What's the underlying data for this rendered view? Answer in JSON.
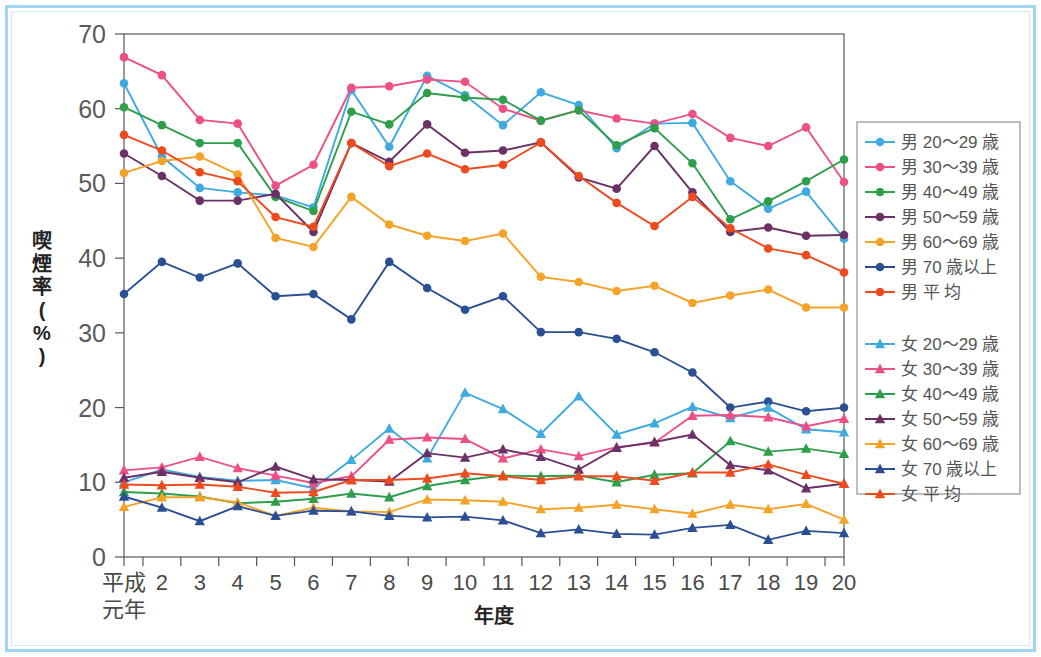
{
  "chart_data": {
    "type": "line",
    "title": "",
    "xlabel": "年度",
    "ylabel": "喫煙率(%)",
    "ylim": [
      0,
      70
    ],
    "ytick_labels": [
      "0",
      "10",
      "20",
      "30",
      "40",
      "50",
      "60",
      "70"
    ],
    "yticks": [
      0,
      10,
      20,
      30,
      40,
      50,
      60,
      70
    ],
    "grid": false,
    "legend_position": "right",
    "x_first_label_line1": "平成",
    "x_first_label_line2": "元年",
    "categories": [
      "平成元年",
      "2",
      "3",
      "4",
      "5",
      "6",
      "7",
      "8",
      "9",
      "10",
      "11",
      "12",
      "13",
      "14",
      "15",
      "16",
      "17",
      "18",
      "19",
      "20"
    ],
    "x_values": [
      1,
      2,
      3,
      4,
      5,
      6,
      7,
      8,
      9,
      10,
      11,
      12,
      13,
      14,
      15,
      16,
      17,
      18,
      19,
      20
    ],
    "series": [
      {
        "name": "男 20～29 歳",
        "group": "male",
        "color": "#3eaae0",
        "marker": "circle",
        "values": [
          63.4,
          53.6,
          49.4,
          48.8,
          48.4,
          46.8,
          62.5,
          54.9,
          64.4,
          61.8,
          57.8,
          62.2,
          60.5,
          54.7,
          58.0,
          58.1,
          50.3,
          46.6,
          48.9,
          42.6
        ]
      },
      {
        "name": "男 30～39 歳",
        "group": "male",
        "color": "#ee4f86",
        "marker": "circle",
        "values": [
          66.9,
          64.5,
          58.5,
          58.0,
          49.7,
          52.5,
          62.8,
          63.0,
          63.9,
          63.6,
          60.0,
          58.4,
          59.8,
          58.7,
          58.0,
          59.3,
          56.1,
          55.0,
          57.5,
          50.2
        ]
      },
      {
        "name": "男 40～49 歳",
        "group": "male",
        "color": "#2e9e4b",
        "marker": "circle",
        "values": [
          60.2,
          57.8,
          55.4,
          55.4,
          48.2,
          46.3,
          59.6,
          57.9,
          62.1,
          61.5,
          61.2,
          58.4,
          59.8,
          55.1,
          57.4,
          52.7,
          45.2,
          47.6,
          50.3,
          53.2
        ]
      },
      {
        "name": "男 50～59 歳",
        "group": "male",
        "color": "#6b3066",
        "marker": "circle",
        "values": [
          54.0,
          51.0,
          47.7,
          47.7,
          48.6,
          43.5,
          55.4,
          52.9,
          57.9,
          54.1,
          54.4,
          55.5,
          50.8,
          49.3,
          55.0,
          48.8,
          43.5,
          44.1,
          43.0,
          43.1
        ]
      },
      {
        "name": "男 60～69 歳",
        "group": "male",
        "color": "#f5a229",
        "marker": "circle",
        "values": [
          51.4,
          53.0,
          53.6,
          51.2,
          42.7,
          41.5,
          48.2,
          44.5,
          43.0,
          42.3,
          43.3,
          37.5,
          36.8,
          35.6,
          36.3,
          34.0,
          35.0,
          35.8,
          33.4,
          33.4
        ]
      },
      {
        "name": "男 70 歳以上",
        "group": "male",
        "color": "#2a4f95",
        "marker": "circle",
        "values": [
          35.2,
          39.5,
          37.4,
          39.3,
          34.9,
          35.2,
          31.8,
          39.5,
          36.0,
          33.1,
          34.9,
          30.1,
          30.1,
          29.2,
          27.4,
          24.7,
          20.0,
          20.8,
          19.5,
          20.0
        ]
      },
      {
        "name": "男 平 均",
        "group": "male",
        "color": "#ef4a1e",
        "marker": "circle",
        "values": [
          56.5,
          54.4,
          51.5,
          50.3,
          45.5,
          44.2,
          55.4,
          52.3,
          54.0,
          51.9,
          52.5,
          55.5,
          51.0,
          47.4,
          44.3,
          48.2,
          44.0,
          41.3,
          40.4,
          38.1
        ]
      },
      {
        "name": "女 20～29 歳",
        "group": "female",
        "color": "#3eaae0",
        "marker": "triangle",
        "values": [
          10.0,
          11.7,
          10.7,
          10.2,
          10.3,
          9.2,
          13.0,
          17.2,
          13.2,
          22.0,
          19.8,
          16.5,
          21.5,
          16.4,
          17.9,
          20.1,
          18.6,
          20.0,
          17.1,
          16.7
        ]
      },
      {
        "name": "女 30～39 歳",
        "group": "female",
        "color": "#ee4f86",
        "marker": "triangle",
        "values": [
          11.6,
          12.0,
          13.4,
          11.9,
          10.9,
          9.9,
          10.8,
          15.7,
          16.0,
          15.8,
          13.2,
          14.4,
          13.5,
          14.7,
          15.3,
          18.9,
          19.0,
          18.7,
          17.5,
          18.5
        ]
      },
      {
        "name": "女 40～49 歳",
        "group": "female",
        "color": "#2e9e4b",
        "marker": "triangle",
        "values": [
          8.7,
          8.5,
          8.1,
          7.2,
          7.4,
          7.8,
          8.5,
          8.0,
          9.5,
          10.3,
          10.9,
          10.8,
          10.9,
          10.0,
          11.0,
          11.2,
          15.5,
          14.1,
          14.5,
          13.8
        ]
      },
      {
        "name": "女 50～59 歳",
        "group": "female",
        "color": "#6b3066",
        "marker": "triangle",
        "values": [
          10.6,
          11.4,
          10.6,
          10.0,
          12.1,
          10.4,
          10.3,
          10.1,
          13.9,
          13.3,
          14.4,
          13.4,
          11.7,
          14.6,
          15.4,
          16.4,
          12.3,
          11.6,
          9.2,
          9.8
        ]
      },
      {
        "name": "女 60～69 歳",
        "group": "female",
        "color": "#f5a229",
        "marker": "triangle",
        "values": [
          6.7,
          8.0,
          8.0,
          7.3,
          5.5,
          6.6,
          6.1,
          6.0,
          7.7,
          7.6,
          7.4,
          6.4,
          6.6,
          7.0,
          6.4,
          5.8,
          7.0,
          6.4,
          7.1,
          5.0
        ]
      },
      {
        "name": "女 70 歳以上",
        "group": "female",
        "color": "#2a4f95",
        "marker": "triangle",
        "values": [
          8.1,
          6.6,
          4.8,
          6.8,
          5.5,
          6.2,
          6.1,
          5.5,
          5.3,
          5.4,
          4.9,
          3.2,
          3.7,
          3.1,
          3.0,
          3.9,
          4.3,
          2.3,
          3.5,
          3.2
        ]
      },
      {
        "name": "女 平 均",
        "group": "female",
        "color": "#ef4a1e",
        "marker": "triangle",
        "values": [
          9.7,
          9.6,
          9.7,
          9.4,
          8.6,
          8.7,
          10.3,
          10.3,
          10.5,
          11.2,
          10.8,
          10.3,
          10.8,
          10.8,
          10.2,
          11.3,
          11.3,
          12.4,
          11.0,
          9.8
        ]
      }
    ]
  },
  "legend": {
    "male_items": [
      "男 20～29 歳",
      "男 30～39 歳",
      "男 40～49 歳",
      "男 50～59 歳",
      "男 60～69 歳",
      "男 70 歳以上",
      "男 平 均"
    ],
    "female_items": [
      "女 20～29 歳",
      "女 30～39 歳",
      "女 40～49 歳",
      "女 50～59 歳",
      "女 60～69 歳",
      "女 70 歳以上",
      "女 平 均"
    ]
  },
  "colors": {
    "age_20_29": "#3eaae0",
    "age_30_39": "#ee4f86",
    "age_40_49": "#2e9e4b",
    "age_50_59": "#6b3066",
    "age_60_69": "#f5a229",
    "age_70_plus": "#2a4f95",
    "average": "#ef4a1e",
    "frame": "#9fd6f2"
  }
}
